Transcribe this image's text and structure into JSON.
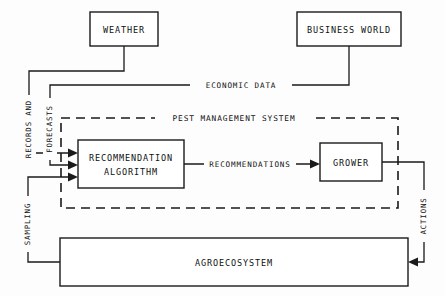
{
  "diagram": {
    "background_color": "#fdfdfd",
    "line_color": "#1a1a1a",
    "nodes": [
      {
        "id": "weather",
        "label": "WEATHER",
        "x": 90,
        "y": 12,
        "w": 68,
        "h": 34
      },
      {
        "id": "business",
        "label": "BUSINESS WORLD",
        "x": 297,
        "y": 12,
        "w": 104,
        "h": 34
      },
      {
        "id": "recommendation",
        "label_line1": "RECOMMENDATION",
        "label_line2": "ALGORITHM",
        "x": 78,
        "y": 140,
        "w": 106,
        "h": 48
      },
      {
        "id": "grower",
        "label": "GROWER",
        "x": 320,
        "y": 143,
        "w": 62,
        "h": 38
      },
      {
        "id": "agroecosystem",
        "label": "AGROECOSYSTEM",
        "x": 60,
        "y": 238,
        "w": 348,
        "h": 48
      }
    ],
    "boundary": {
      "id": "pest-management-system",
      "label": "PEST MANAGEMENT SYSTEM",
      "x": 61,
      "y": 118,
      "w": 337,
      "h": 90,
      "style": "dashed"
    },
    "edge_labels": [
      {
        "id": "economic-data",
        "label": "ECONOMIC DATA",
        "orientation": "horizontal"
      },
      {
        "id": "recommendations",
        "label": "RECOMMENDATIONS",
        "orientation": "horizontal"
      },
      {
        "id": "records-and",
        "label": "RECORDS  AND",
        "orientation": "vertical"
      },
      {
        "id": "forecasts",
        "label": "FORECASTS",
        "orientation": "vertical"
      },
      {
        "id": "sampling",
        "label": "SAMPLING",
        "orientation": "vertical"
      },
      {
        "id": "actions",
        "label": "ACTIONS",
        "orientation": "vertical"
      }
    ]
  }
}
